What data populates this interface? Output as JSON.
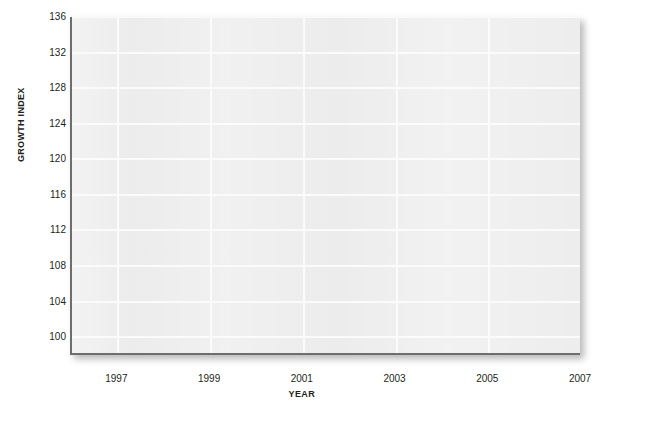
{
  "chart_data": {
    "type": "line",
    "title": "",
    "subtitle": "",
    "xlabel": "YEAR",
    "ylabel": "GROWTH INDEX",
    "xlim": [
      1996,
      2007
    ],
    "ylim": [
      98,
      136
    ],
    "xticks": [
      "1997",
      "1999",
      "2001",
      "2003",
      "2005",
      "2007"
    ],
    "yticks": [
      "100",
      "104",
      "108",
      "112",
      "116",
      "120",
      "124",
      "128",
      "132",
      "136"
    ],
    "grid": "both",
    "legend": "none",
    "series": [],
    "annotations": [],
    "note": "Empty plot frame: gridded axes with no plotted data series visible."
  },
  "style": {
    "plot_background": "#ececec",
    "gridline_color": "#fbfbfb",
    "axis_color": "#6e6e6e",
    "text_color": "#231f20",
    "page_background": "#ffffff"
  }
}
